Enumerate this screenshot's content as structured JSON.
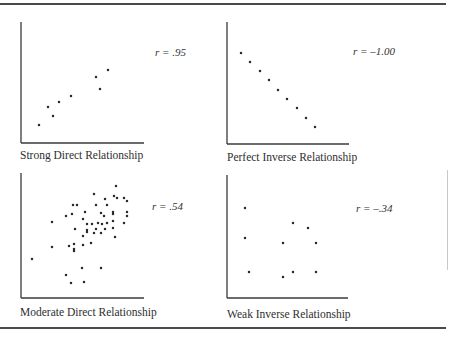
{
  "chart_data": [
    {
      "type": "scatter",
      "title": "Strong Direct Relationship",
      "annotation": "r = .95",
      "r": 0.95,
      "xlabel": "",
      "ylabel": "",
      "grid": false,
      "axes_px": {
        "x0": 21,
        "y0": 143,
        "x1": 144,
        "ytop": 22
      },
      "points_px": [
        [
          39,
          125
        ],
        [
          48,
          107
        ],
        [
          53,
          116
        ],
        [
          59,
          102
        ],
        [
          71,
          96
        ],
        [
          96,
          77
        ],
        [
          100,
          89
        ],
        [
          108,
          70
        ]
      ]
    },
    {
      "type": "scatter",
      "title": "Perfect Inverse Relationship",
      "annotation": "r = –1.00",
      "r": -1.0,
      "xlabel": "",
      "ylabel": "",
      "grid": false,
      "axes_px": {
        "x0": 227,
        "y0": 144,
        "x1": 349,
        "ytop": 22
      },
      "points_px": [
        [
          241,
          53
        ],
        [
          250,
          62
        ],
        [
          260,
          71
        ],
        [
          269,
          80
        ],
        [
          278,
          90
        ],
        [
          287,
          99
        ],
        [
          297,
          108
        ],
        [
          306,
          118
        ],
        [
          315,
          127
        ]
      ]
    },
    {
      "type": "scatter",
      "title": "Moderate Direct Relationship",
      "annotation": "r = .54",
      "r": 0.54,
      "xlabel": "",
      "ylabel": "",
      "grid": false,
      "axes_px": {
        "x0": 21,
        "y0": 298,
        "x1": 144,
        "ytop": 173
      },
      "points_px": [
        [
          116,
          186
        ],
        [
          94,
          194
        ],
        [
          114,
          196
        ],
        [
          117,
          198
        ],
        [
          124,
          198
        ],
        [
          127,
          201
        ],
        [
          105,
          199
        ],
        [
          73,
          205
        ],
        [
          77,
          205
        ],
        [
          96,
          205
        ],
        [
          107,
          205
        ],
        [
          85,
          212
        ],
        [
          101,
          213
        ],
        [
          113,
          212
        ],
        [
          127,
          212
        ],
        [
          66,
          216
        ],
        [
          72,
          214
        ],
        [
          104,
          216
        ],
        [
          113,
          214
        ],
        [
          127,
          216
        ],
        [
          83,
          219
        ],
        [
          52,
          222
        ],
        [
          87,
          224
        ],
        [
          92,
          224
        ],
        [
          98,
          223
        ],
        [
          102,
          224
        ],
        [
          107,
          223
        ],
        [
          113,
          221
        ],
        [
          124,
          223
        ],
        [
          75,
          229
        ],
        [
          87,
          230
        ],
        [
          87,
          232
        ],
        [
          96,
          229
        ],
        [
          105,
          229
        ],
        [
          113,
          228
        ],
        [
          94,
          233
        ],
        [
          101,
          233
        ],
        [
          83,
          236
        ],
        [
          115,
          237
        ],
        [
          91,
          243
        ],
        [
          74,
          244
        ],
        [
          69,
          246
        ],
        [
          83,
          245
        ],
        [
          52,
          247
        ],
        [
          74,
          249
        ],
        [
          74,
          251
        ],
        [
          32,
          259
        ],
        [
          82,
          268
        ],
        [
          101,
          268
        ],
        [
          66,
          275
        ],
        [
          84,
          282
        ],
        [
          71,
          283
        ]
      ]
    },
    {
      "type": "scatter",
      "title": "Weak Inverse Relationship",
      "annotation": "r = –.34",
      "r": -0.34,
      "xlabel": "",
      "ylabel": "",
      "grid": false,
      "axes_px": {
        "x0": 227,
        "y0": 298,
        "x1": 348,
        "ytop": 175
      },
      "points_px": [
        [
          245,
          208
        ],
        [
          293,
          223
        ],
        [
          308,
          228
        ],
        [
          245,
          238
        ],
        [
          283,
          243
        ],
        [
          316,
          243
        ],
        [
          249,
          272
        ],
        [
          293,
          272
        ],
        [
          316,
          272
        ],
        [
          283,
          277
        ]
      ]
    }
  ],
  "panels": [
    {
      "caption": "Strong Direct Relationship",
      "r_label": "r = .95"
    },
    {
      "caption": "Perfect Inverse Relationship",
      "r_label": "r = –1.00"
    },
    {
      "caption": "Moderate Direct Relationship",
      "r_label": "r = .54"
    },
    {
      "caption": "Weak Inverse Relationship",
      "r_label": "r = –.34"
    }
  ],
  "colors": {
    "axis": "#3a3a3a",
    "dot": "#2a2a2a",
    "rule": "#4a4a4a"
  }
}
